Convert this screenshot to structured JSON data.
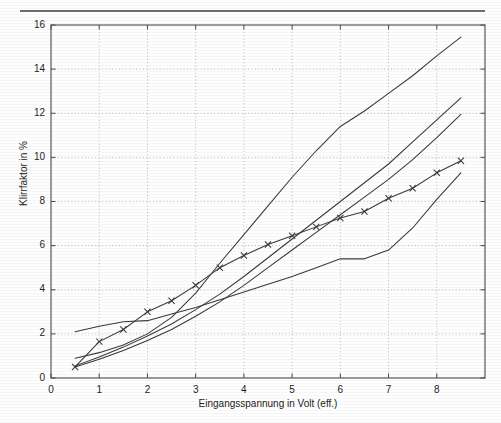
{
  "page": {
    "top_rule": "horizontal-rule"
  },
  "chart_data": {
    "type": "line",
    "title": "",
    "xlabel": "Eingangsspannung in Volt (eff.)",
    "ylabel": "Klirrfaktor in %",
    "xlim": [
      0,
      9
    ],
    "ylim": [
      0,
      16
    ],
    "xticks": [
      0,
      1,
      2,
      3,
      4,
      5,
      6,
      7,
      8
    ],
    "yticks": [
      0,
      2,
      4,
      6,
      8,
      10,
      12,
      14,
      16
    ],
    "xtick_labels": [
      "0",
      "1",
      "2",
      "3",
      "4",
      "5",
      "6",
      "7",
      "8"
    ],
    "ytick_labels": [
      "0",
      "2",
      "4",
      "6",
      "8",
      "10",
      "12",
      "14",
      "16"
    ],
    "grid": true,
    "grid_style": "dotted",
    "legend": "none",
    "line_color": "#3a3a3a",
    "series": [
      {
        "name": "curve-steepest",
        "marker": "none",
        "x": [
          0.5,
          1.0,
          1.5,
          2.0,
          2.5,
          3.0,
          3.5,
          4.0,
          4.5,
          5.0,
          5.5,
          6.0,
          6.5,
          7.0,
          7.5,
          8.0,
          8.5
        ],
        "y": [
          0.9,
          1.15,
          1.5,
          2.0,
          2.75,
          3.85,
          5.2,
          6.5,
          7.8,
          9.1,
          10.3,
          11.4,
          12.1,
          12.9,
          13.7,
          14.6,
          15.45
        ]
      },
      {
        "name": "curve-second",
        "marker": "none",
        "x": [
          0.5,
          1.0,
          1.5,
          2.0,
          2.5,
          3.0,
          3.5,
          4.0,
          4.5,
          5.0,
          5.5,
          6.0,
          6.5,
          7.0,
          7.5,
          8.0,
          8.5
        ],
        "y": [
          0.55,
          0.95,
          1.4,
          1.9,
          2.45,
          3.1,
          3.8,
          4.6,
          5.45,
          6.3,
          7.15,
          8.0,
          8.85,
          9.7,
          10.7,
          11.7,
          12.7
        ]
      },
      {
        "name": "curve-third",
        "marker": "none",
        "x": [
          0.5,
          1.0,
          1.5,
          2.0,
          2.5,
          3.0,
          3.5,
          4.0,
          4.5,
          5.0,
          5.5,
          6.0,
          6.5,
          7.0,
          7.5,
          8.0,
          8.5
        ],
        "y": [
          0.5,
          0.85,
          1.25,
          1.7,
          2.2,
          2.8,
          3.45,
          4.2,
          5.0,
          5.8,
          6.6,
          7.4,
          8.2,
          9.0,
          9.9,
          10.9,
          11.95
        ]
      },
      {
        "name": "curve-with-x-markers",
        "marker": "x",
        "x": [
          0.5,
          1.0,
          1.5,
          2.0,
          2.5,
          3.0,
          3.5,
          4.0,
          4.5,
          5.0,
          5.5,
          6.0,
          6.5,
          7.0,
          7.5,
          8.0,
          8.5
        ],
        "y": [
          0.5,
          1.65,
          2.2,
          3.0,
          3.5,
          4.2,
          5.0,
          5.55,
          6.05,
          6.45,
          6.85,
          7.25,
          7.55,
          8.15,
          8.6,
          9.3,
          9.85
        ]
      },
      {
        "name": "curve-lowest-with-plateau",
        "marker": "none",
        "x": [
          0.5,
          1.0,
          1.5,
          2.0,
          2.5,
          3.0,
          3.5,
          4.0,
          4.5,
          5.0,
          5.5,
          6.0,
          6.5,
          7.0,
          7.5,
          8.0,
          8.5
        ],
        "y": [
          2.1,
          2.35,
          2.55,
          2.6,
          2.9,
          3.2,
          3.55,
          3.9,
          4.25,
          4.6,
          5.0,
          5.4,
          5.4,
          5.8,
          6.8,
          8.1,
          9.3
        ]
      }
    ]
  }
}
